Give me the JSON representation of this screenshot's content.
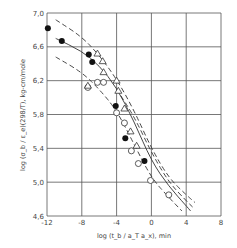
{
  "chart_data": {
    "type": "scatter",
    "title": "",
    "xlabel": "log (t_b / a_T a_x), min",
    "ylabel": "log (σ_b / ε_e)(298/T), kg-cm/mole",
    "xlim": [
      -12,
      8
    ],
    "ylim": [
      4.6,
      7.0
    ],
    "xticks": [
      "-12",
      "-8",
      "-4",
      "0",
      "4",
      "8"
    ],
    "yticks": [
      "4,6",
      "5,0",
      "5,4",
      "5,8",
      "6,2",
      "6,6",
      "7,0"
    ],
    "grid": true,
    "legend": "none",
    "series": [
      {
        "name": "filled circles",
        "marker": "filled-circle",
        "points": [
          [
            -11.9,
            6.82
          ],
          [
            -10.3,
            6.67
          ],
          [
            -7.2,
            6.51
          ],
          [
            -6.8,
            6.42
          ],
          [
            -4.1,
            5.9
          ],
          [
            -3.0,
            5.52
          ],
          [
            -0.8,
            5.25
          ]
        ]
      },
      {
        "name": "open circles",
        "marker": "open-circle",
        "points": [
          [
            -7.3,
            6.12
          ],
          [
            -6.2,
            6.18
          ],
          [
            -5.5,
            6.18
          ],
          [
            -4.0,
            5.82
          ],
          [
            -3.1,
            5.7
          ],
          [
            -2.3,
            5.37
          ],
          [
            -1.5,
            5.22
          ],
          [
            -0.1,
            5.02
          ],
          [
            2.0,
            4.85
          ]
        ]
      },
      {
        "name": "open triangles",
        "marker": "open-triangle",
        "points": [
          [
            -7.3,
            6.14
          ],
          [
            -6.2,
            6.52
          ],
          [
            -5.6,
            6.43
          ],
          [
            -5.5,
            6.3
          ],
          [
            -4.0,
            6.2
          ],
          [
            -3.8,
            6.08
          ],
          [
            -3.1,
            5.87
          ],
          [
            -2.4,
            5.6
          ],
          [
            -1.7,
            5.43
          ]
        ]
      }
    ],
    "curves": [
      {
        "name": "upper dashed",
        "style": "dashed",
        "points": [
          [
            -11,
            6.92
          ],
          [
            -8,
            6.72
          ],
          [
            -6,
            6.5
          ],
          [
            -4,
            6.22
          ],
          [
            -2,
            5.85
          ],
          [
            0,
            5.4
          ],
          [
            2,
            5.05
          ],
          [
            4,
            4.85
          ],
          [
            5,
            4.76
          ]
        ]
      },
      {
        "name": "solid",
        "style": "solid",
        "points": [
          [
            -11,
            6.7
          ],
          [
            -8,
            6.55
          ],
          [
            -6,
            6.38
          ],
          [
            -4,
            6.12
          ],
          [
            -2,
            5.72
          ],
          [
            0,
            5.25
          ],
          [
            2,
            4.95
          ],
          [
            4,
            4.72
          ],
          [
            4.5,
            4.66
          ]
        ]
      },
      {
        "name": "middle dashed",
        "style": "dashed",
        "points": [
          [
            -4,
            6.1
          ],
          [
            -2,
            5.78
          ],
          [
            0,
            5.35
          ],
          [
            2,
            5.0
          ],
          [
            4,
            4.78
          ],
          [
            4.8,
            4.7
          ]
        ]
      },
      {
        "name": "lower dashed",
        "style": "dashed",
        "points": [
          [
            -11,
            6.48
          ],
          [
            -8,
            6.3
          ],
          [
            -6,
            6.1
          ],
          [
            -4,
            5.85
          ],
          [
            -2,
            5.45
          ],
          [
            0,
            5.05
          ],
          [
            2,
            4.82
          ],
          [
            3.5,
            4.66
          ]
        ]
      }
    ]
  }
}
